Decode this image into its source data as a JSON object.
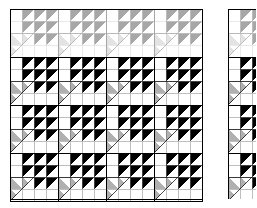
{
  "image": {
    "title": "Quilt block tiling diagram",
    "width": 257,
    "height": 208,
    "background_color": "#ffffff",
    "description": "A repeating pieced-quilt block laid out as a grid of identical blocks, plus a narrow cropped strip of the same pattern at the right edge."
  },
  "palette": {
    "background": "#ffffff",
    "patch_white": "#ffffff",
    "patch_light": "#f4f4f4",
    "patch_gray": "#b0b0b0",
    "patch_gray_dark": "#a2a2a2",
    "patch_black": "#000000",
    "outline": "#000000",
    "outline_light": "#808080"
  },
  "layout": {
    "main_panel": {
      "label": "main-quilt-grid",
      "x": 10,
      "y": 9,
      "width": 192,
      "height": 190,
      "block_columns": 4,
      "block_rows": 4,
      "block_size": 48,
      "border_color": "#000000",
      "border_width": 1
    },
    "side_panel": {
      "label": "cropped-quilt-strip",
      "x": 228,
      "y": 9,
      "width": 28,
      "height": 190,
      "block_columns": 1,
      "block_rows": 4,
      "block_size": 48,
      "clipped": true,
      "border_color": "#000000",
      "border_width": 1
    },
    "faded_top_row": {
      "label": "overexposed-top-row",
      "applies_to_block_row": 0,
      "opacity": 0.34,
      "note": "Top row of blocks is washed out / low contrast in the source scan"
    }
  },
  "block": {
    "name": "birds-in-the-air-variation",
    "grid": 4,
    "cell": 12,
    "description": "Within each 48x48 block: a large gray triangle covers the lower-left half; small black half-square triangles step across the upper-right; plain white squares fill the remaining lower-right area.",
    "large_gray_triangle": {
      "fill": "#b0b0b0",
      "points": "0,24 24,24 0,48 0,24",
      "note": "gray wedge anchored on the left edge of the block"
    },
    "cells": [
      {
        "r": 0,
        "c": 0,
        "type": "plain",
        "fill": "#ffffff"
      },
      {
        "r": 0,
        "c": 1,
        "type": "hst",
        "fill": "#000000",
        "dir": "tl"
      },
      {
        "r": 0,
        "c": 2,
        "type": "hst",
        "fill": "#000000",
        "dir": "tl"
      },
      {
        "r": 0,
        "c": 3,
        "type": "hst",
        "fill": "#000000",
        "dir": "tl"
      },
      {
        "r": 1,
        "c": 0,
        "type": "plain",
        "fill": "#ffffff"
      },
      {
        "r": 1,
        "c": 1,
        "type": "hst",
        "fill": "#000000",
        "dir": "tl"
      },
      {
        "r": 1,
        "c": 2,
        "type": "hst",
        "fill": "#000000",
        "dir": "tl"
      },
      {
        "r": 1,
        "c": 3,
        "type": "hst",
        "fill": "#000000",
        "dir": "tl"
      },
      {
        "r": 2,
        "c": 0,
        "type": "gray-wedge",
        "fill": "#b0b0b0"
      },
      {
        "r": 2,
        "c": 1,
        "type": "gray-wedge",
        "fill": "#b0b0b0"
      },
      {
        "r": 2,
        "c": 2,
        "type": "hst",
        "fill": "#000000",
        "dir": "tl"
      },
      {
        "r": 2,
        "c": 3,
        "type": "hst",
        "fill": "#000000",
        "dir": "tl"
      },
      {
        "r": 3,
        "c": 0,
        "type": "gray-wedge",
        "fill": "#b0b0b0"
      },
      {
        "r": 3,
        "c": 1,
        "type": "plain",
        "fill": "#ffffff"
      },
      {
        "r": 3,
        "c": 2,
        "type": "plain",
        "fill": "#ffffff"
      },
      {
        "r": 3,
        "c": 3,
        "type": "plain",
        "fill": "#ffffff"
      }
    ]
  }
}
